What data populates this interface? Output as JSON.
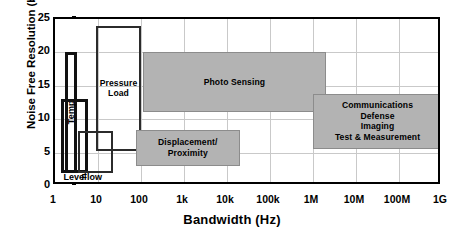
{
  "chart_data": {
    "type": "bar",
    "title": "",
    "xlabel": "Bandwidth (Hz)",
    "ylabel": "Noise Free Resolution (bits)",
    "x_scale": "log",
    "xlim": [
      1,
      1000000000
    ],
    "ylim": [
      0,
      25
    ],
    "grid": true,
    "legend": "none",
    "x_ticks": [
      "1",
      "10",
      "100",
      "1k",
      "10k",
      "100k",
      "1M",
      "10M",
      "100M",
      "1G"
    ],
    "x_tick_values": [
      1,
      10,
      100,
      1000,
      10000,
      100000,
      1000000,
      10000000,
      100000000,
      1000000000
    ],
    "y_ticks": [
      "0",
      "5",
      "10",
      "15",
      "20",
      "25"
    ],
    "y_tick_values": [
      0,
      5,
      10,
      15,
      20,
      25
    ],
    "regions": [
      {
        "name": "temp",
        "label": "Temp",
        "orientation": "vertical",
        "style": "outlined-heavy",
        "x_range": [
          1.7,
          3.3
        ],
        "y_range": [
          2.0,
          20.0
        ]
      },
      {
        "name": "level",
        "label": "Level",
        "label_position": "below",
        "orientation": "horizontal",
        "style": "outlined-heavy",
        "x_range": [
          1.35,
          6.0
        ],
        "y_range": [
          2.0,
          13.0
        ]
      },
      {
        "name": "pressure-load",
        "label": "Pressure\nLoad",
        "orientation": "horizontal",
        "style": "outlined",
        "x_range": [
          9.0,
          100.0
        ],
        "y_range": [
          5.2,
          24.0
        ]
      },
      {
        "name": "flow",
        "label": "Flow",
        "label_position": "below",
        "orientation": "horizontal",
        "style": "outlined",
        "x_range": [
          3.5,
          22.0
        ],
        "y_range": [
          2.0,
          8.3
        ]
      },
      {
        "name": "photo-sensing",
        "label": "Photo Sensing",
        "orientation": "horizontal",
        "style": "filled",
        "x_range": [
          110.0,
          2000000.0
        ],
        "y_range": [
          11.0,
          20.0
        ]
      },
      {
        "name": "displacement-proximity",
        "label": "Displacement/\nProximity",
        "orientation": "horizontal",
        "style": "filled",
        "x_range": [
          75.0,
          20000.0
        ],
        "y_range": [
          3.0,
          8.4
        ]
      },
      {
        "name": "communications-defense-imaging-test",
        "label": "Communications\nDefense\nImaging\nTest & Measurement",
        "orientation": "horizontal",
        "style": "filled",
        "x_range": [
          1000000.0,
          1000000000.0
        ],
        "y_range": [
          5.6,
          13.8
        ]
      }
    ],
    "colors": {
      "region_fill": "#b3b3b3",
      "region_fill_border": "#8c8c8c",
      "outline": "#2b2b2b",
      "outline_heavy": "#111111",
      "grid": "#c9c9c9",
      "axis": "#000000",
      "background": "#ffffff"
    }
  }
}
